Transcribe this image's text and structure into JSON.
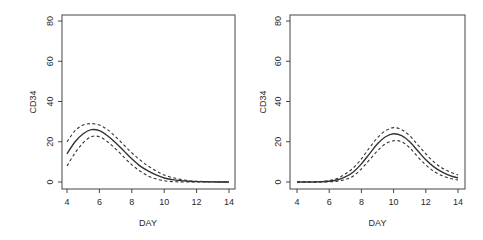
{
  "chart_data": [
    {
      "type": "line",
      "title": "",
      "xlabel": "DAY",
      "ylabel": "CD34",
      "xlim": [
        4,
        14
      ],
      "ylim": [
        0,
        80
      ],
      "xticks": [
        4,
        6,
        8,
        10,
        12,
        14
      ],
      "yticks": [
        0,
        20,
        40,
        60,
        80
      ],
      "grid": false,
      "legend": null,
      "x": [
        4,
        4.5,
        5,
        5.5,
        6,
        6.5,
        7,
        7.5,
        8,
        8.5,
        9,
        9.5,
        10,
        10.5,
        11,
        11.5,
        12,
        12.5,
        13,
        13.5,
        14
      ],
      "series": [
        {
          "name": "estimate",
          "style": "solid",
          "values": [
            14,
            20,
            24,
            26,
            25.5,
            23,
            19.5,
            15.5,
            11.5,
            8,
            5.5,
            3.5,
            2,
            1.2,
            0.7,
            0.4,
            0.2,
            0.1,
            0.05,
            0.02,
            0
          ]
        },
        {
          "name": "upper",
          "style": "dashed",
          "values": [
            20,
            25.5,
            28.3,
            29,
            28.3,
            26,
            22.5,
            18.5,
            14.5,
            11,
            8,
            5.5,
            3.5,
            2.2,
            1.3,
            0.7,
            0.4,
            0.2,
            0.1,
            0.05,
            0
          ]
        },
        {
          "name": "lower",
          "style": "dashed",
          "values": [
            8,
            14.5,
            19.5,
            22.5,
            22.5,
            20,
            16.5,
            12.5,
            8.5,
            5.5,
            3,
            1.5,
            0.6,
            0.2,
            0.05,
            0,
            0,
            0,
            0,
            0,
            0
          ]
        }
      ]
    },
    {
      "type": "line",
      "title": "",
      "xlabel": "DAY",
      "ylabel": "CD34",
      "xlim": [
        4,
        14
      ],
      "ylim": [
        0,
        80
      ],
      "xticks": [
        4,
        6,
        8,
        10,
        12,
        14
      ],
      "yticks": [
        0,
        20,
        40,
        60,
        80
      ],
      "grid": false,
      "legend": null,
      "x": [
        4,
        4.5,
        5,
        5.5,
        6,
        6.5,
        7,
        7.5,
        8,
        8.5,
        9,
        9.5,
        10,
        10.5,
        11,
        11.5,
        12,
        12.5,
        13,
        13.5,
        14
      ],
      "series": [
        {
          "name": "estimate",
          "style": "solid",
          "values": [
            0,
            0,
            0,
            0.1,
            0.4,
            1,
            2.5,
            5,
            9,
            14,
            19,
            22.5,
            24,
            23,
            20,
            15.5,
            11,
            7.5,
            5,
            3.2,
            2
          ]
        },
        {
          "name": "upper",
          "style": "dashed",
          "values": [
            0,
            0,
            0,
            0.2,
            0.7,
            1.7,
            4,
            7,
            11.5,
            17,
            22,
            25.5,
            27,
            26,
            23,
            18.5,
            14,
            10,
            7,
            5,
            3.5
          ]
        },
        {
          "name": "lower",
          "style": "dashed",
          "values": [
            0,
            0,
            0,
            0,
            0.1,
            0.4,
            1.2,
            3,
            6.5,
            11,
            15.5,
            19,
            20.5,
            20,
            17,
            12.5,
            8.5,
            5.3,
            3.2,
            1.8,
            1
          ]
        }
      ]
    }
  ]
}
